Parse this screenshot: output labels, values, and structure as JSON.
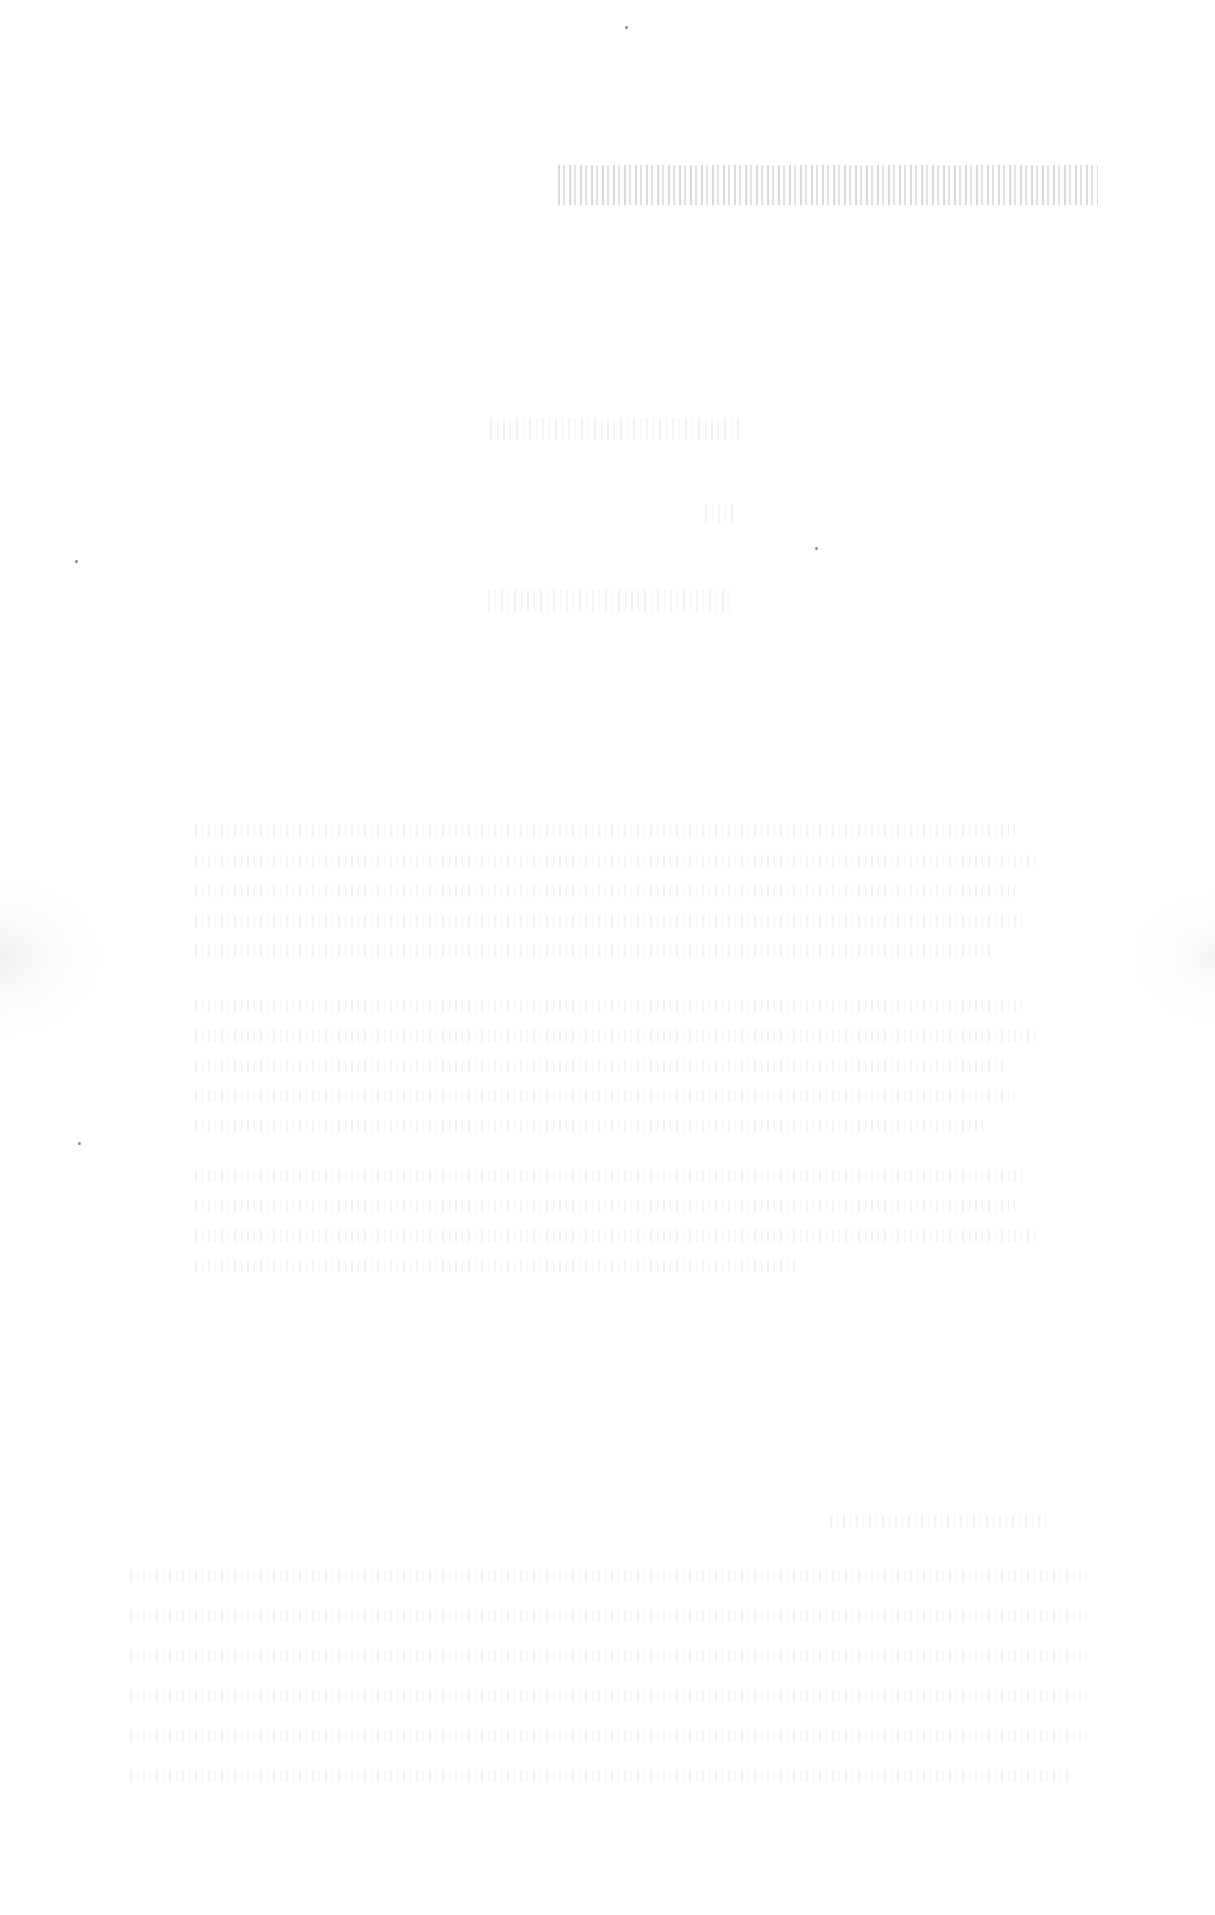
{
  "document": {
    "type": "scanned-page",
    "legibility": "illegible",
    "header": {
      "text": "[illegible]",
      "align": "right"
    },
    "title_block": [
      {
        "text": "[illegible]"
      },
      {
        "text": "[illegible]"
      },
      {
        "text": "[illegible]"
      }
    ],
    "paragraphs": [
      {
        "text": "[illegible]"
      },
      {
        "text": "[illegible]"
      },
      {
        "text": "[illegible]"
      },
      {
        "text": "[illegible]"
      },
      {
        "text": "[illegible]"
      }
    ]
  }
}
